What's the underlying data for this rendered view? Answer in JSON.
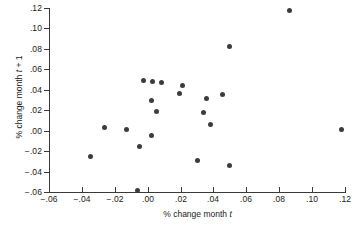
{
  "chart_data": {
    "type": "scatter",
    "title": "",
    "xlabel": "% change month t",
    "ylabel": "% change month t + 1",
    "xlabel_prefix": "% change month ",
    "xlabel_italic": "t",
    "xlabel_suffix": "",
    "ylabel_prefix": "% change month ",
    "ylabel_italic": "t",
    "ylabel_suffix": " + 1",
    "xlim": [
      -0.06,
      0.12
    ],
    "ylim": [
      -0.06,
      0.12
    ],
    "xticks": [
      -0.06,
      -0.04,
      -0.02,
      0.0,
      0.02,
      0.04,
      0.06,
      0.08,
      0.1,
      0.12
    ],
    "yticks": [
      -0.06,
      -0.04,
      -0.02,
      0.0,
      0.02,
      0.04,
      0.06,
      0.08,
      0.1,
      0.12
    ],
    "xtick_labels": [
      "-.06",
      "-.04",
      "-.02",
      ".00",
      ".02",
      ".04",
      ".06",
      ".08",
      ".10",
      ".12"
    ],
    "ytick_labels": [
      "-.06",
      "-.04",
      "-.02",
      ".00",
      ".02",
      ".04",
      ".06",
      ".08",
      ".10",
      ".12"
    ],
    "grid": false,
    "legend": false,
    "marker": "filled-circle",
    "marker_color": "#3c3c3c",
    "axis_color": "#3a3a3a",
    "points": [
      {
        "x": -0.0345,
        "y": -0.0255
      },
      {
        "x": -0.0265,
        "y": 0.003
      },
      {
        "x": -0.013,
        "y": 0.001
      },
      {
        "x": -0.006,
        "y": -0.058
      },
      {
        "x": -0.005,
        "y": -0.015
      },
      {
        "x": -0.0025,
        "y": 0.049
      },
      {
        "x": 0.002,
        "y": 0.0295
      },
      {
        "x": 0.0025,
        "y": -0.0045
      },
      {
        "x": 0.003,
        "y": 0.0485
      },
      {
        "x": 0.0055,
        "y": 0.019
      },
      {
        "x": 0.0085,
        "y": 0.047
      },
      {
        "x": 0.0195,
        "y": 0.036
      },
      {
        "x": 0.021,
        "y": 0.044
      },
      {
        "x": 0.03,
        "y": -0.029
      },
      {
        "x": 0.034,
        "y": 0.0175
      },
      {
        "x": 0.036,
        "y": 0.032
      },
      {
        "x": 0.038,
        "y": 0.0065
      },
      {
        "x": 0.0455,
        "y": 0.035
      },
      {
        "x": 0.0495,
        "y": 0.082
      },
      {
        "x": 0.05,
        "y": -0.034
      },
      {
        "x": 0.086,
        "y": 0.118
      },
      {
        "x": 0.118,
        "y": 0.001
      }
    ]
  }
}
